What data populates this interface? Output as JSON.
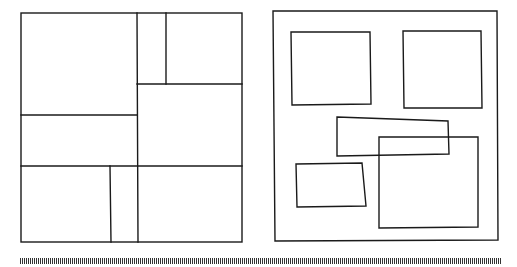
{
  "figure": {
    "stroke_color": "#1a1a1a",
    "background": "#ffffff",
    "left_panel": {
      "description": "guillotine partition of a square into rectangles",
      "outer": [
        21,
        13,
        242,
        242
      ],
      "segments": [
        [
          137,
          13,
          138,
          242
        ],
        [
          166,
          13,
          166,
          84
        ],
        [
          137,
          84,
          242,
          84
        ],
        [
          21,
          115,
          137,
          115
        ],
        [
          21,
          166,
          242,
          166
        ],
        [
          110,
          166,
          111,
          242
        ]
      ]
    },
    "right_panel": {
      "description": "scattered, partly overlapping, non-guillotine rectangles",
      "outer": [
        [
          273,
          11
        ],
        [
          497,
          11
        ],
        [
          498,
          240
        ],
        [
          275,
          241
        ]
      ],
      "shapes": [
        {
          "name": "rect-a",
          "points": [
            [
              291,
              32
            ],
            [
              370,
              32
            ],
            [
              371,
              104
            ],
            [
              292,
              105
            ]
          ]
        },
        {
          "name": "rect-b",
          "points": [
            [
              403,
              31
            ],
            [
              481,
              31
            ],
            [
              482,
              108
            ],
            [
              404,
              108
            ]
          ]
        },
        {
          "name": "quad-c",
          "points": [
            [
              337,
              117
            ],
            [
              448,
              121
            ],
            [
              449,
              154
            ],
            [
              337,
              156
            ]
          ]
        },
        {
          "name": "rect-d",
          "points": [
            [
              379,
              137
            ],
            [
              478,
              137
            ],
            [
              478,
              227
            ],
            [
              379,
              228
            ]
          ]
        },
        {
          "name": "quad-e",
          "points": [
            [
              296,
              164
            ],
            [
              362,
              163
            ],
            [
              366,
              206
            ],
            [
              297,
              207
            ]
          ]
        }
      ]
    },
    "tick_strip": {
      "x_start": 20,
      "x_end": 500,
      "y": 258,
      "height": 6,
      "spacing": 2
    }
  }
}
